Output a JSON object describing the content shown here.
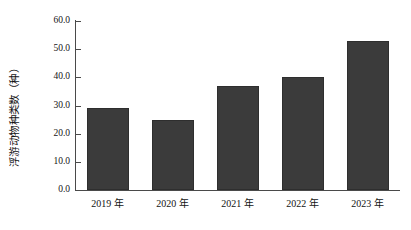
{
  "chart_data": {
    "type": "bar",
    "title": "",
    "xlabel": "",
    "ylabel": "浮游动物种类数（种）",
    "categories": [
      "2019 年",
      "2020 年",
      "2021 年",
      "2022 年",
      "2023 年"
    ],
    "values": [
      29,
      25,
      37,
      40,
      53
    ],
    "ylim": [
      0,
      60
    ],
    "yticks": [
      "0.0",
      "10.0",
      "20.0",
      "30.0",
      "40.0",
      "50.0",
      "60.0"
    ],
    "ytick_values": [
      0,
      10,
      20,
      30,
      40,
      50,
      60
    ],
    "grid": false,
    "legend": "none",
    "bar_color": "#3b3b3b",
    "axis_color": "#4a4a4a",
    "background": "#ffffff"
  }
}
